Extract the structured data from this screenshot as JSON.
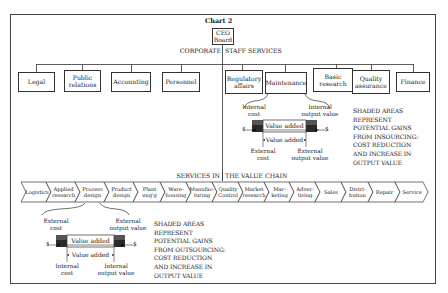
{
  "title": "Chart 2",
  "ceo": {
    "line1": "CEO",
    "line2": "Board"
  },
  "corporate_header": {
    "left": "CORPORATE",
    "right": "STAFF SERVICES"
  },
  "staff_services": [
    {
      "line1": "Legal",
      "line2": ""
    },
    {
      "line1": "Public",
      "line2": "relations"
    },
    {
      "line1": "Accounting",
      "line2": ""
    },
    {
      "line1": "Personnel",
      "line2": ""
    },
    {
      "line1": "Regulatory",
      "line2": "affairs"
    },
    {
      "line1": "Maintenance",
      "line2": ""
    },
    {
      "line1": "Basic",
      "line2": "research"
    },
    {
      "line1": "Quality",
      "line2": "assurance"
    },
    {
      "line1": "Finance",
      "line2": ""
    }
  ],
  "insourcing": {
    "top_left": {
      "line1": "Internal",
      "line2": "cost"
    },
    "top_right": {
      "line1": "Internal",
      "line2": "output value"
    },
    "bar_label": "Value added",
    "bracket_label": "Value added",
    "bottom_left": {
      "line1": "External",
      "line2": "cost"
    },
    "bottom_right": {
      "line1": "External",
      "line2": "output value"
    },
    "currency": "$",
    "note": [
      "SHADED AREAS",
      "REPRESENT",
      "POTENTIAL GAINS",
      "FROM INSOURCING:",
      "COST REDUCTION",
      "AND INCREASE IN",
      "OUTPUT VALUE"
    ]
  },
  "value_chain_header": {
    "left": "SERVICES IN",
    "right": "THE VALUE CHAIN"
  },
  "value_chain": [
    {
      "line1": "Logistics",
      "line2": ""
    },
    {
      "line1": "Applied",
      "line2": "research"
    },
    {
      "line1": "Process",
      "line2": "design"
    },
    {
      "line1": "Product",
      "line2": "design"
    },
    {
      "line1": "Plant",
      "line2": "eng'g"
    },
    {
      "line1": "Ware-",
      "line2": "housing"
    },
    {
      "line1": "Manufac-",
      "line2": "turing"
    },
    {
      "line1": "Quality",
      "line2": "Control"
    },
    {
      "line1": "Market",
      "line2": "research"
    },
    {
      "line1": "Mar-",
      "line2": "keting"
    },
    {
      "line1": "Adver-",
      "line2": "tising"
    },
    {
      "line1": "Sales",
      "line2": ""
    },
    {
      "line1": "Distri-",
      "line2": "bution"
    },
    {
      "line1": "Repair",
      "line2": ""
    },
    {
      "line1": "Service",
      "line2": ""
    }
  ],
  "outsourcing": {
    "top_left": {
      "line1": "External",
      "line2": "cost"
    },
    "top_right": {
      "line1": "External",
      "line2": "output value"
    },
    "bar_label": "Value added",
    "bracket_label": "Value added",
    "bottom_left": {
      "line1": "Internal",
      "line2": "cost"
    },
    "bottom_right": {
      "line1": "Internal",
      "line2": "output value"
    },
    "currency": "$",
    "note": [
      "SHADED AREAS",
      "REPRESENT",
      "POTENTIAL GAINS",
      "FROM OUTSOURCING:",
      "COST REDUCTION",
      "AND INCREASE IN",
      "OUTPUT VALUE"
    ]
  }
}
